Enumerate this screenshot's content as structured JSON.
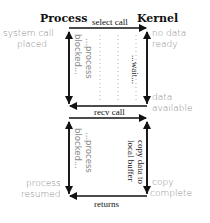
{
  "headers": {
    "process": "Process",
    "kernel": "Kernel"
  },
  "calls": {
    "select": "select call",
    "recv": "recv call",
    "returns": "returns"
  },
  "process_notes": {
    "syscall_line1": "system call",
    "syscall_line2": "placed",
    "resumed_line1": "process",
    "resumed_line2": "resumed"
  },
  "kernel_notes": {
    "no_data_line1": "no data",
    "no_data_line2": "ready",
    "available_line1": "data",
    "available_line2": "available",
    "copy_line1": "copy",
    "copy_line2": "complete"
  },
  "vertical_labels": {
    "top_process_a": "...process",
    "top_process_b": "blocked...",
    "top_kernel": "...wait...",
    "bottom_process_a": "...process",
    "bottom_process_b": "blocked...",
    "bottom_kernel_a": "copy data to",
    "bottom_kernel_b": "local buffer"
  }
}
